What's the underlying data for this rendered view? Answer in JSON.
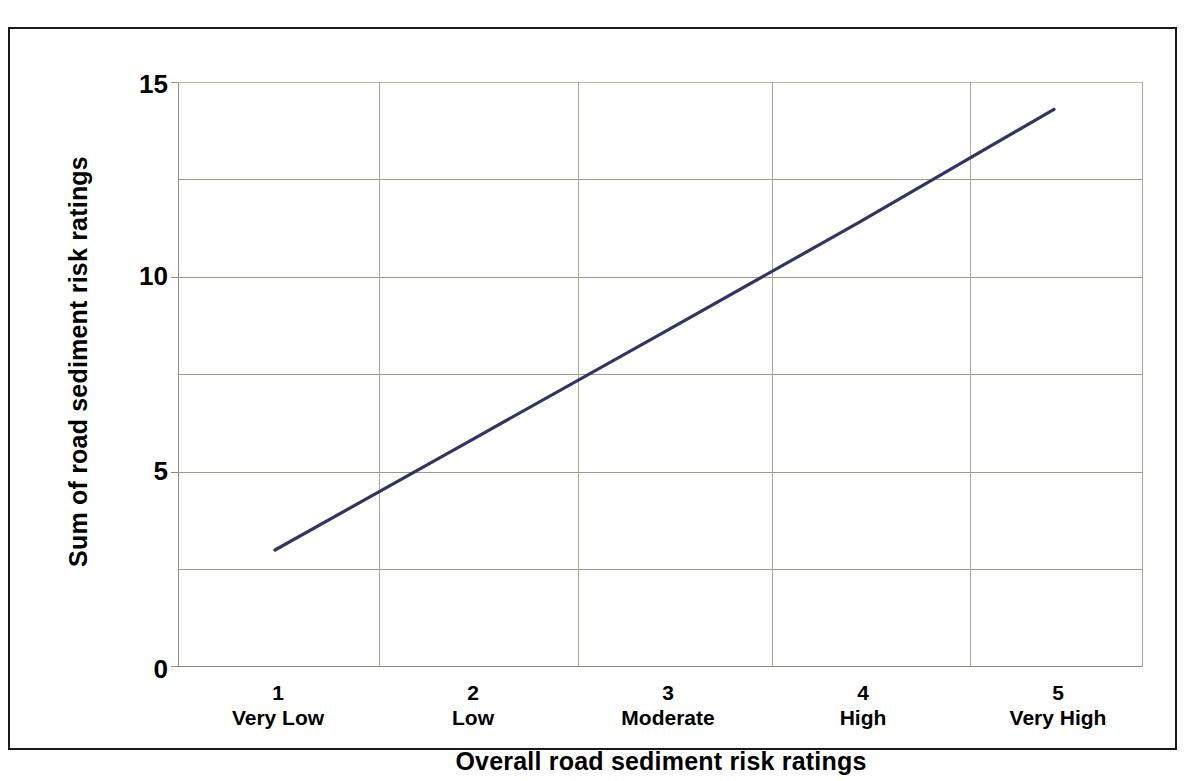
{
  "chart_data": {
    "type": "line",
    "title": "",
    "xlabel": "Overall road sediment risk ratings",
    "ylabel": "Sum of road sediment risk ratings",
    "categories": [
      "1",
      "2",
      "3",
      "4",
      "5"
    ],
    "category_names": [
      "Very Low",
      "Low",
      "Moderate",
      "High",
      "Very High"
    ],
    "series": [
      {
        "name": "Sum of road sediment risk ratings",
        "color": "#333366",
        "values": [
          3.0,
          5.8,
          8.6,
          11.4,
          14.3
        ]
      }
    ],
    "ylim": [
      0,
      15
    ],
    "yticks": [
      0,
      5,
      10,
      15
    ],
    "ytick_labels": [
      "0",
      "5",
      "10",
      "15"
    ],
    "gridlines_y": [
      0,
      2.5,
      5,
      7.5,
      10,
      12.5,
      15
    ],
    "grid": true,
    "grid_axis": "both",
    "legend": false,
    "legend_position": "none",
    "line_width": 3,
    "markers": false
  },
  "axis": {
    "y_title": "Sum of road sediment risk ratings",
    "x_title": "Overall road sediment risk ratings",
    "y_labels": [
      "15",
      "10",
      "5",
      "0"
    ],
    "x_ticks": [
      {
        "number": "1",
        "name": "Very Low"
      },
      {
        "number": "2",
        "name": "Low"
      },
      {
        "number": "3",
        "name": "Moderate"
      },
      {
        "number": "4",
        "name": "High"
      },
      {
        "number": "5",
        "name": "Very High"
      }
    ]
  },
  "colors": {
    "series_line": "#333366",
    "gridline": "#9a9a88",
    "axis_line": "#8e8e80",
    "frame_border": "#1a1a1a",
    "text": "#000000",
    "background": "#ffffff"
  }
}
